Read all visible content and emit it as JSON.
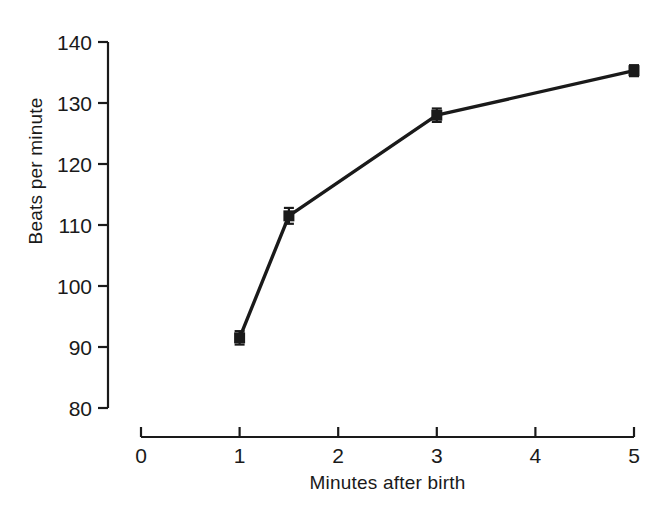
{
  "chart_data": {
    "type": "line",
    "title": "",
    "subtitle": "",
    "xlabel": "Minutes after birth",
    "ylabel": "Beats per minute",
    "xlim": [
      0,
      5
    ],
    "ylim": [
      80,
      140
    ],
    "xticks": [
      0,
      1,
      2,
      3,
      4,
      5
    ],
    "yticks": [
      80,
      90,
      100,
      110,
      120,
      130,
      140
    ],
    "xtick_labels": [
      "0",
      "1",
      "2",
      "3",
      "4",
      "5"
    ],
    "ytick_labels": [
      "80",
      "90",
      "100",
      "110",
      "120",
      "130",
      "140"
    ],
    "grid": false,
    "legend": null,
    "marker": "square",
    "line_color": "#1a1a1a",
    "marker_color": "#1a1a1a",
    "error_bars": true,
    "x": [
      1,
      1.5,
      3,
      5
    ],
    "values": [
      91.5,
      111.5,
      128.0,
      135.3
    ],
    "yerr": [
      1.1,
      1.3,
      1.1,
      0.9
    ],
    "series": [
      {
        "name": "Heart rate",
        "points": [
          {
            "x": 1,
            "y": 91.5,
            "err": 1.1
          },
          {
            "x": 1.5,
            "y": 111.5,
            "err": 1.3
          },
          {
            "x": 3,
            "y": 128.0,
            "err": 1.1
          },
          {
            "x": 5,
            "y": 135.3,
            "err": 0.9
          }
        ]
      }
    ],
    "annotations": []
  },
  "figure": {
    "background_color": "#ffffff",
    "axis_color": "#2b2b2b",
    "x_axis_label": "Minutes after birth",
    "y_axis_label": "Beats per minute"
  }
}
